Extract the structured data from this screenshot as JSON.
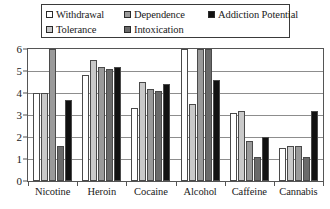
{
  "chart_data": {
    "type": "bar",
    "title": "",
    "xlabel": "",
    "ylabel": "",
    "ylim": [
      0,
      6
    ],
    "yticks": [
      0,
      1,
      2,
      3,
      4,
      5,
      6
    ],
    "grid": true,
    "legend_position": "top",
    "categories": [
      "Nicotine",
      "Heroin",
      "Cocaine",
      "Alcohol",
      "Caffeine",
      "Cannabis"
    ],
    "series": [
      {
        "name": "Withdrawal",
        "color": "#ffffff",
        "values": [
          4.0,
          4.8,
          3.3,
          6.0,
          3.1,
          1.5
        ]
      },
      {
        "name": "Tolerance",
        "color": "#c9c9c9",
        "values": [
          4.0,
          5.5,
          4.5,
          3.5,
          3.2,
          1.6
        ]
      },
      {
        "name": "Dependence",
        "color": "#9a9a9a",
        "values": [
          6.0,
          5.2,
          4.2,
          6.0,
          1.8,
          1.6
        ]
      },
      {
        "name": "Intoxication",
        "color": "#6a6a6a",
        "values": [
          1.6,
          5.1,
          4.1,
          6.0,
          1.1,
          1.1
        ]
      },
      {
        "name": "Addiction Potential",
        "color": "#111111",
        "values": [
          3.7,
          5.2,
          4.4,
          4.6,
          2.0,
          3.2
        ]
      }
    ]
  },
  "legend": {
    "row1": [
      {
        "label": "Withdrawal",
        "swatch": "legend-swatch-withdrawal"
      },
      {
        "label": "Dependence",
        "swatch": "legend-swatch-dependence"
      },
      {
        "label": "Addiction Potential",
        "swatch": "legend-swatch-addiction-potential"
      }
    ],
    "row2": [
      {
        "label": "Tolerance",
        "swatch": "legend-swatch-tolerance"
      },
      {
        "label": "Intoxication",
        "swatch": "legend-swatch-intoxication"
      }
    ]
  },
  "axis": {
    "y_tick_labels": [
      "6",
      "5",
      "4",
      "3",
      "2",
      "1",
      "0"
    ]
  }
}
